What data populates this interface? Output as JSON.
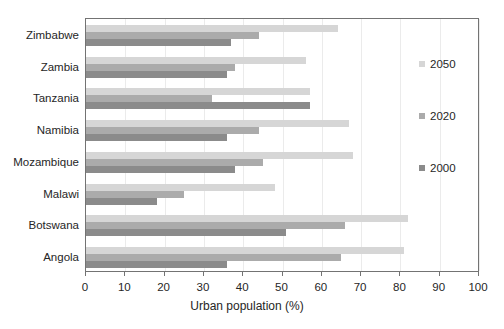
{
  "chart_data": {
    "type": "bar",
    "orientation": "horizontal",
    "title": "",
    "xlabel": "Urban population (%)",
    "ylabel": "",
    "xlim": [
      0,
      100
    ],
    "xticks": [
      0,
      10,
      20,
      30,
      40,
      50,
      60,
      70,
      80,
      90,
      100
    ],
    "grid": true,
    "legend_position": "right",
    "categories": [
      "Zimbabwe",
      "Zambia",
      "Tanzania",
      "Namibia",
      "Mozambique",
      "Malawi",
      "Botswana",
      "Angola"
    ],
    "series": [
      {
        "name": "2050",
        "color": "#d6d6d6",
        "values": [
          64,
          56,
          57,
          67,
          68,
          48,
          82,
          81
        ]
      },
      {
        "name": "2020",
        "color": "#ababab",
        "values": [
          44,
          38,
          32,
          44,
          45,
          25,
          66,
          65
        ]
      },
      {
        "name": "2000",
        "color": "#8b8b8b",
        "values": [
          37,
          36,
          57,
          36,
          38,
          18,
          51,
          36
        ]
      }
    ]
  },
  "colors": {
    "plot_border": "#737373",
    "gridline": "#ebebeb",
    "text": "#262626"
  }
}
